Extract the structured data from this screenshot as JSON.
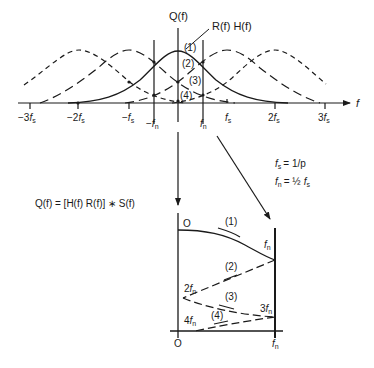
{
  "top_plot": {
    "y_axis_label": "Q(f)",
    "x_axis_label": "f",
    "curve_label": "R(f) H(f)",
    "region_labels": [
      "(1)",
      "(2)",
      "(3)",
      "(4)"
    ],
    "ticks": [
      {
        "coef": "−3",
        "sub": "s"
      },
      {
        "coef": "−2",
        "sub": "s"
      },
      {
        "coef": "−",
        "sub": "s"
      },
      {
        "coef": "−",
        "sub": "n"
      },
      {
        "coef": "",
        "sub": "n"
      },
      {
        "coef": "",
        "sub": "s"
      },
      {
        "coef": "2",
        "sub": "s"
      },
      {
        "coef": "3",
        "sub": "s"
      }
    ]
  },
  "annotations": {
    "fs_def": "= 1/p",
    "fn_def": "= ½",
    "equation": "Q(f) = [H(f) R(f)] ∗ S(f)"
  },
  "bottom_plot": {
    "origin_top": "O",
    "origin_bottom": "O",
    "fold_labels": {
      "fn_top": "n",
      "two_fn": "2",
      "three_fn": "3",
      "four_fn": "4",
      "fn_bottom": "n"
    },
    "segment_labels": [
      "(1)",
      "(2)",
      "(3)",
      "(4)"
    ]
  }
}
